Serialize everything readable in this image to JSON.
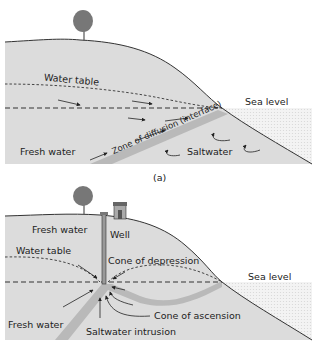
{
  "panel_a": {
    "caption": "(a)",
    "labels": {
      "water_table": "Water table",
      "sea_level": "Sea level",
      "fresh_water": "Fresh water",
      "zone_of_diffusion": "Zone of diffusion (interface)",
      "saltwater": "Saltwater"
    }
  },
  "panel_b": {
    "labels": {
      "fresh_water_top": "Fresh water",
      "well": "Well",
      "water_table": "Water table",
      "cone_of_depression": "Cone of depression",
      "sea_level": "Sea level",
      "fresh_water_bottom": "Fresh water",
      "cone_of_ascension": "Cone of ascension",
      "saltwater_intrusion": "Saltwater intrusion"
    }
  },
  "colors": {
    "land": "#dcdcdc",
    "interface": "#b9b9b9",
    "sea": "#ececec",
    "line": "#333333"
  }
}
